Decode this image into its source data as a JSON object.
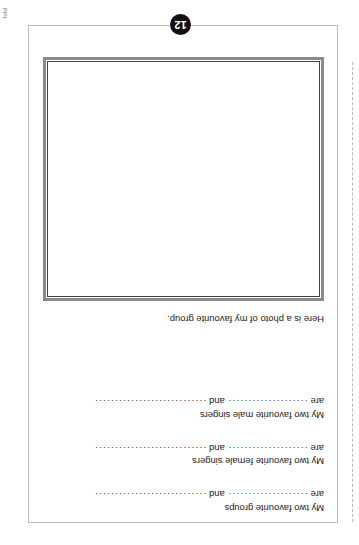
{
  "sheet": {
    "fold_label": "fold",
    "page_number": "12"
  },
  "worksheet": {
    "photo_caption": "Here is a photo of my favourite group.",
    "prompts": [
      {
        "title": "My two favourite groups",
        "lead": "are",
        "dots1": "····················",
        "conjunction": "and",
        "dots2": "····························"
      },
      {
        "title": "My two favourite female singers",
        "lead": "are",
        "dots1": "····················",
        "conjunction": "and",
        "dots2": "····························"
      },
      {
        "title": "My two favourite male singers",
        "lead": "are",
        "dots1": "····················",
        "conjunction": "and",
        "dots2": "····························"
      }
    ]
  }
}
